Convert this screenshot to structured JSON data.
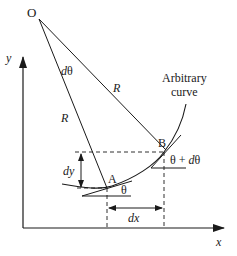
{
  "diagram": {
    "labels": {
      "origin": "O",
      "dtheta": "dθ",
      "radius_upper": "R",
      "radius_lower": "R",
      "curve": [
        "Arbitrary",
        "curve"
      ],
      "point_a": "A",
      "point_b": "B",
      "theta": "θ",
      "theta_plus_dtheta": "θ + dθ",
      "dy": "dy",
      "dx": "dx",
      "y_axis": "y",
      "x_axis": "x"
    },
    "colors": {
      "stroke": "#1a1a1a",
      "background": "#ffffff"
    }
  }
}
